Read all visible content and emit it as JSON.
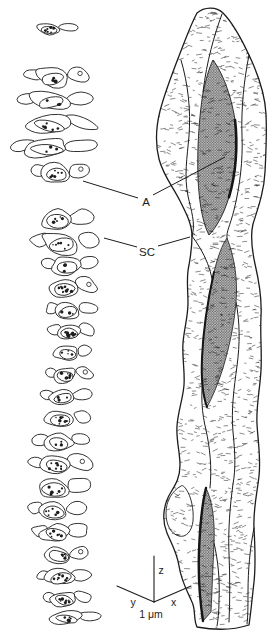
{
  "canvas": {
    "background": "#ffffff",
    "ink": "#1c1c1c",
    "stipple_gray": "#c6c6c6"
  },
  "annotations": {
    "a": "A",
    "sc": "SC"
  },
  "axes": {
    "z": "z",
    "y": "y",
    "x": "x",
    "scale": "1 μm"
  }
}
